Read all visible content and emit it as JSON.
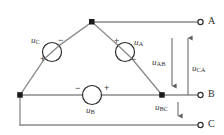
{
  "figure": {
    "type": "delta-connected-three-phase-source-schematic",
    "canvas": {
      "width": 224,
      "height": 135
    },
    "colors": {
      "background": "#ffffff",
      "wire": "#8a8a8a",
      "node": "#1a1a1a",
      "text": "#3a3a3a",
      "arrow": "#6d6d6d"
    }
  },
  "sources": [
    {
      "id": "source-a",
      "label": "u",
      "subscript": "A",
      "plus": "+",
      "minus": "−",
      "cx": 125,
      "cy": 52,
      "r": 9.5
    },
    {
      "id": "source-b",
      "label": "u",
      "subscript": "B",
      "plus": "+",
      "minus": "−",
      "cx": 92,
      "cy": 95,
      "r": 9.5
    },
    {
      "id": "source-c",
      "label": "u",
      "subscript": "C",
      "plus": "+",
      "minus": "−",
      "cx": 52,
      "cy": 52,
      "r": 9.5
    }
  ],
  "line_voltages": [
    {
      "id": "u-ab",
      "label": "u",
      "subscript": "AB",
      "direction": "down",
      "x": 172,
      "y_top": 38,
      "y_bottom": 86
    },
    {
      "id": "u-ca",
      "label": "u",
      "subscript": "CA",
      "direction": "up",
      "x": 188,
      "y_top": 38,
      "y_bottom": 95
    },
    {
      "id": "u-bc",
      "label": "u",
      "subscript": "BC",
      "direction": "down",
      "x": 178,
      "y_top": 102,
      "y_bottom": 116
    }
  ],
  "terminals": [
    {
      "id": "terminal-a",
      "label": "A",
      "cx": 202,
      "cy": 22
    },
    {
      "id": "terminal-b",
      "label": "B",
      "cx": 202,
      "cy": 95
    },
    {
      "id": "terminal-c",
      "label": "C",
      "cx": 202,
      "cy": 125
    }
  ],
  "nodes": [
    {
      "id": "node-apex",
      "x": 92,
      "y": 22
    },
    {
      "id": "node-left",
      "x": 20,
      "y": 95
    },
    {
      "id": "node-right",
      "x": 162,
      "y": 95
    }
  ]
}
